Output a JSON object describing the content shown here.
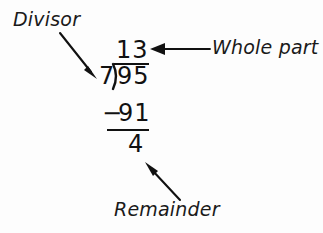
{
  "figure": {
    "background_color": "#fdfdfd",
    "ink_color": "#111111"
  },
  "problem": {
    "divisor": "7",
    "dividend": "95",
    "quotient": "13",
    "subtrahend": "91",
    "minus_sign": "−",
    "remainder": "4"
  },
  "annotations": {
    "divisor_label": "Divisor",
    "whole_part_label": "Whole part",
    "remainder_label": "Remainder"
  },
  "arrows": [
    {
      "name": "divisor-arrow",
      "points_to": "divisor",
      "direction": "down-right",
      "from": [
        60,
        33
      ],
      "to": [
        97,
        78
      ]
    },
    {
      "name": "whole-part-arrow",
      "points_to": "quotient",
      "direction": "left",
      "from": [
        210,
        49
      ],
      "to": [
        150,
        49
      ]
    },
    {
      "name": "remainder-arrow",
      "points_to": "remainder",
      "direction": "up-left",
      "from": [
        180,
        200
      ],
      "to": [
        146,
        163
      ]
    }
  ]
}
